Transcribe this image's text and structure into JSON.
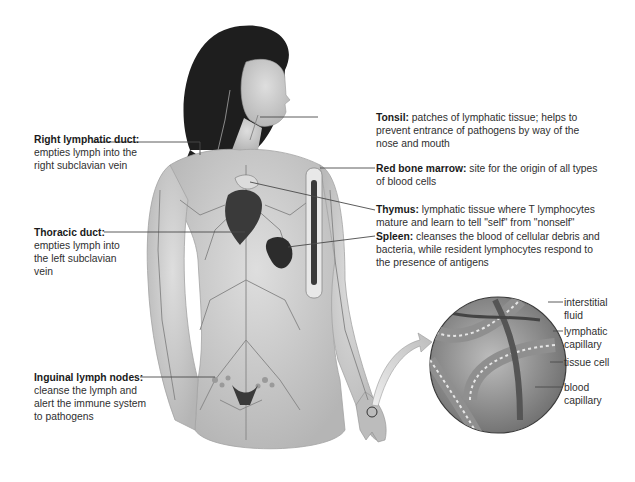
{
  "figure": {
    "callouts_left": [
      {
        "id": "right-lymphatic-duct",
        "term": "Right lymphatic duct:",
        "lines": [
          "empties lymph into the",
          "right subclavian vein"
        ]
      },
      {
        "id": "thoracic-duct",
        "term": "Thoracic duct:",
        "lines": [
          "empties lymph into",
          "the left  subclavian",
          "vein"
        ]
      },
      {
        "id": "inguinal-lymph-nodes",
        "term": "Inguinal lymph nodes:",
        "lines": [
          "cleanse the lymph and",
          "alert the immune system",
          "to pathogens"
        ]
      }
    ],
    "callouts_right": [
      {
        "id": "tonsil",
        "term": "Tonsil:",
        "lines": [
          " patches of lymphatic tissue; helps to",
          "prevent entrance of pathogens by way of the",
          "nose and mouth"
        ]
      },
      {
        "id": "red-bone-marrow",
        "term": "Red bone marrow:",
        "lines": [
          " site for the origin of all types",
          "of blood cells"
        ]
      },
      {
        "id": "thymus",
        "term": "Thymus:",
        "lines": [
          " lymphatic tissue where T lymphocytes",
          "mature and  learn to tell \"self\" from \"nonself\""
        ]
      },
      {
        "id": "spleen",
        "term": "Spleen:",
        "lines": [
          " cleanses the blood of cellular debris and",
          "bacteria, while  resident lymphocytes respond to",
          "the presence of antigens"
        ]
      }
    ],
    "inset_labels": [
      {
        "id": "interstitial-fluid",
        "lines": [
          "interstitial",
          "fluid"
        ]
      },
      {
        "id": "lymphatic-capillary",
        "lines": [
          "lymphatic",
          "capillary"
        ]
      },
      {
        "id": "tissue-cell",
        "lines": [
          "tissue cell"
        ]
      },
      {
        "id": "blood-capillary",
        "lines": [
          "blood",
          "capillary"
        ]
      }
    ]
  },
  "colors": {
    "leader_line": "#4a4a4a",
    "skin": "#c9c9c9",
    "vessel": "#8a8a8a",
    "hair": "#1e1e1e",
    "organ": "#3a3a3a"
  }
}
